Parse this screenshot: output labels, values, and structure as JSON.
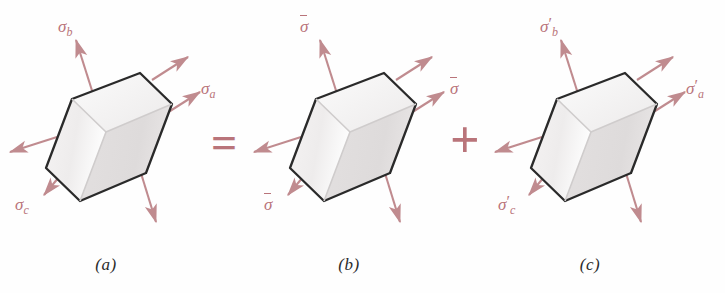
{
  "figure": {
    "background_color": "#fefefe",
    "arrow_color": "#c08b8f",
    "label_color": "#b9747a",
    "cube_outline_color": "#2a2a2a",
    "operators": {
      "equals": "=",
      "plus": "+"
    },
    "panels": [
      {
        "id": "a",
        "caption": "(a)",
        "labels": [
          {
            "name": "sigma-b",
            "base": "σ",
            "sub": "b",
            "prime": false,
            "overbar": false
          },
          {
            "name": "sigma-a",
            "base": "σ",
            "sub": "a",
            "prime": false,
            "overbar": false
          },
          {
            "name": "sigma-c",
            "base": "σ",
            "sub": "c",
            "prime": false,
            "overbar": false
          }
        ]
      },
      {
        "id": "b",
        "caption": "(b)",
        "labels": [
          {
            "name": "sigma-bar-top",
            "base": "σ",
            "sub": "",
            "prime": false,
            "overbar": true
          },
          {
            "name": "sigma-bar-right",
            "base": "σ",
            "sub": "",
            "prime": false,
            "overbar": true
          },
          {
            "name": "sigma-bar-bottom-left",
            "base": "σ",
            "sub": "",
            "prime": false,
            "overbar": true
          }
        ]
      },
      {
        "id": "c",
        "caption": "(c)",
        "labels": [
          {
            "name": "sigma-prime-b",
            "base": "σ",
            "sub": "b",
            "prime": true,
            "overbar": false
          },
          {
            "name": "sigma-prime-a",
            "base": "σ",
            "sub": "a",
            "prime": true,
            "overbar": false
          },
          {
            "name": "sigma-prime-c",
            "base": "σ",
            "sub": "c",
            "prime": true,
            "overbar": false
          }
        ]
      }
    ],
    "text": {
      "caption_a": "(a)",
      "caption_b": "(b)",
      "caption_c": "(c)",
      "equals": "=",
      "plus": "+",
      "sigma": "σ",
      "sub_a": "a",
      "sub_b": "b",
      "sub_c": "c",
      "prime": "′"
    }
  }
}
